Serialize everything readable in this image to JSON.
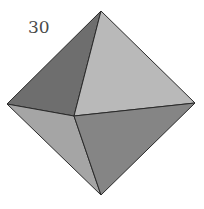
{
  "figure": {
    "label": "30",
    "shape": "octahedron",
    "vertices": {
      "top": [
        101,
        11
      ],
      "left": [
        7,
        104
      ],
      "right": [
        195,
        103
      ],
      "center": [
        74,
        116
      ],
      "bottom": [
        101,
        195
      ]
    },
    "colors": {
      "upper_left_face": "#6e6e6e",
      "upper_right_face": "#b9b9b9",
      "lower_left_face": "#a5a5a5",
      "lower_right_face": "#858585",
      "edge": "#2a2a2a"
    }
  }
}
